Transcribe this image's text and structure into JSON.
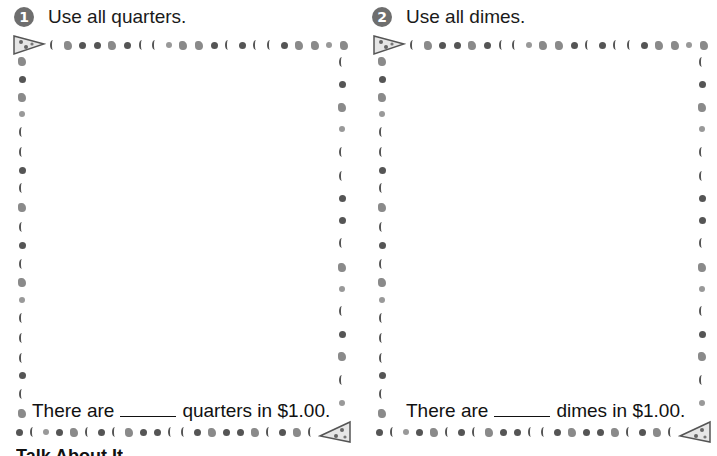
{
  "problems": [
    {
      "number": "1",
      "instruction": "Use all quarters.",
      "sentence_before": "There are",
      "sentence_after": "quarters in $1.00.",
      "answer_blank": ""
    },
    {
      "number": "2",
      "instruction": "Use all dimes.",
      "sentence_before": "There are",
      "sentence_after": "dimes in $1.00.",
      "answer_blank": ""
    }
  ],
  "border": {
    "theme": "pizza-toppings",
    "corner_icon": "pizza-slice-icon",
    "topping_icons": [
      "pepperoni-icon",
      "pepper-icon",
      "mushroom-icon",
      "olive-icon"
    ]
  },
  "footer": {
    "cut_off_text": "Talk About It"
  },
  "colors": {
    "badge": "#6e6e6e",
    "text": "#1a1a1a",
    "border_icons": "#555555"
  }
}
